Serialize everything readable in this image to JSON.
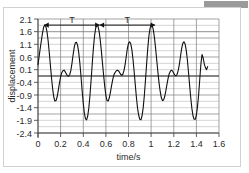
{
  "chart_data": {
    "type": "line",
    "title": "",
    "xlabel": "time/s",
    "ylabel": "displacement",
    "xlim": [
      0,
      1.6
    ],
    "ylim": [
      -2.4,
      2.1
    ],
    "xticks": [
      "0",
      "0.2",
      "0.4",
      "0.6",
      "0.8",
      "1",
      "1.2",
      "1.4",
      "1.6"
    ],
    "xtick_values": [
      0,
      0.2,
      0.4,
      0.6,
      0.8,
      1.0,
      1.2,
      1.4,
      1.6
    ],
    "yticks": [
      "2.1",
      "1.6",
      "1.1",
      "0.6",
      "0.1",
      "-0.4",
      "-0.9",
      "-1.4",
      "-1.9",
      "-2.4"
    ],
    "ytick_values": [
      2.1,
      1.6,
      1.1,
      0.6,
      0.1,
      -0.4,
      -0.9,
      -1.4,
      -1.9,
      -2.4
    ],
    "grid": true,
    "grid_minor": true,
    "legend": "none",
    "series": [
      {
        "name": "displacement",
        "x": [
          0.0,
          0.01,
          0.02,
          0.03,
          0.04,
          0.05,
          0.06,
          0.07,
          0.08,
          0.09,
          0.1,
          0.11,
          0.12,
          0.13,
          0.14,
          0.15,
          0.16,
          0.17,
          0.18,
          0.19,
          0.2,
          0.21,
          0.22,
          0.23,
          0.24,
          0.25,
          0.26,
          0.27,
          0.28,
          0.29,
          0.3,
          0.31,
          0.32,
          0.33,
          0.34,
          0.35,
          0.36,
          0.37,
          0.38,
          0.39,
          0.4,
          0.41,
          0.42,
          0.43,
          0.44,
          0.45,
          0.46,
          0.47,
          0.48,
          0.49,
          0.5,
          0.51,
          0.52,
          0.53,
          0.54,
          0.55,
          0.56,
          0.57,
          0.58,
          0.59,
          0.6,
          0.61,
          0.62,
          0.63,
          0.64,
          0.65,
          0.66,
          0.67,
          0.68,
          0.69,
          0.7,
          0.71,
          0.72,
          0.73,
          0.74,
          0.75,
          0.76,
          0.77,
          0.78,
          0.79,
          0.8,
          0.81,
          0.82,
          0.83,
          0.84,
          0.85,
          0.86,
          0.87,
          0.88,
          0.89,
          0.9,
          0.91,
          0.92,
          0.93,
          0.94,
          0.95,
          0.96,
          0.97,
          0.98,
          0.99,
          1.0,
          1.01,
          1.02,
          1.03,
          1.04,
          1.05,
          1.06,
          1.07,
          1.08,
          1.09,
          1.1,
          1.11,
          1.12,
          1.13,
          1.14,
          1.15,
          1.16,
          1.17,
          1.18,
          1.19,
          1.2,
          1.21,
          1.22,
          1.23,
          1.24,
          1.25,
          1.26,
          1.27,
          1.28,
          1.29,
          1.3,
          1.31,
          1.32,
          1.33,
          1.34,
          1.35,
          1.36,
          1.37,
          1.38,
          1.39,
          1.4,
          1.41,
          1.42,
          1.43,
          1.44,
          1.45,
          1.46,
          1.47,
          1.48,
          1.49,
          1.5
        ],
        "y": [
          0.3,
          0.62,
          0.95,
          1.25,
          1.55,
          1.78,
          1.86,
          1.8,
          1.58,
          1.22,
          0.76,
          0.25,
          -0.25,
          -0.68,
          -1.0,
          -1.14,
          -1.12,
          -0.96,
          -0.7,
          -0.42,
          -0.18,
          -0.02,
          0.06,
          0.08,
          0.02,
          -0.06,
          -0.14,
          -0.16,
          -0.1,
          0.06,
          0.34,
          0.68,
          0.98,
          1.16,
          1.18,
          1.06,
          0.78,
          0.36,
          -0.16,
          -0.72,
          -1.22,
          -1.62,
          -1.84,
          -1.88,
          -1.72,
          -1.38,
          -0.88,
          -0.28,
          0.36,
          0.96,
          1.44,
          1.74,
          1.86,
          1.82,
          1.62,
          1.28,
          0.84,
          0.36,
          -0.12,
          -0.56,
          -0.92,
          -1.12,
          -1.14,
          -1.02,
          -0.8,
          -0.54,
          -0.3,
          -0.12,
          -0.02,
          0.04,
          0.08,
          0.06,
          0.0,
          -0.08,
          -0.12,
          -0.08,
          0.06,
          0.3,
          0.62,
          0.94,
          1.14,
          1.2,
          1.12,
          0.88,
          0.5,
          0.02,
          -0.5,
          -1.0,
          -1.42,
          -1.7,
          -1.86,
          -1.88,
          -1.72,
          -1.4,
          -0.92,
          -0.32,
          0.32,
          0.92,
          1.42,
          1.72,
          1.86,
          1.84,
          1.66,
          1.34,
          0.92,
          0.46,
          0.0,
          -0.42,
          -0.76,
          -1.0,
          -1.12,
          -1.1,
          -0.96,
          -0.74,
          -0.48,
          -0.24,
          -0.06,
          0.04,
          0.08,
          0.04,
          -0.04,
          -0.12,
          -0.14,
          -0.08,
          0.08,
          0.32,
          0.64,
          0.94,
          1.14,
          1.2,
          1.12,
          0.88,
          0.5,
          0.02,
          -0.5,
          -1.0,
          -1.42,
          -1.72,
          -1.86,
          -1.86,
          -1.7,
          -1.36,
          -0.88,
          -0.28,
          0.32,
          0.7,
          0.56,
          0.32,
          0.18,
          0.1,
          0.22
        ]
      }
    ],
    "annotations": [
      {
        "label": "T",
        "type": "double-arrow",
        "x_start": 0.055,
        "x_end": 0.545,
        "y": 1.86,
        "label_x": 0.3,
        "label_y": 2.06,
        "meaning": "period"
      },
      {
        "label": "T",
        "type": "double-arrow",
        "x_start": 0.545,
        "x_end": 1.035,
        "y": 1.86,
        "label_x": 0.79,
        "label_y": 2.06,
        "meaning": "period"
      }
    ]
  }
}
